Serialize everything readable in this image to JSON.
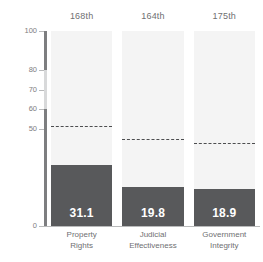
{
  "chart_data": {
    "type": "bar",
    "title": "",
    "subtitle": "",
    "xlabel": "",
    "ylabel": "",
    "ylim": [
      0,
      100
    ],
    "grid": false,
    "legend_position": "none",
    "categories": [
      "Property Rights",
      "Judicial Effectiveness",
      "Government Integrity"
    ],
    "series": [
      {
        "name": "Score",
        "values": [
          31.1,
          19.8,
          18.9
        ]
      },
      {
        "name": "Reference average",
        "values": [
          51.5,
          44.6,
          42.6
        ]
      }
    ],
    "value_labels": [
      "31.1",
      "19.8",
      "18.9"
    ],
    "rank_labels": [
      "168th",
      "164th",
      "175th"
    ],
    "y_ticks": [
      {
        "value": 100,
        "label": "100"
      },
      {
        "value": 80,
        "label": "80"
      },
      {
        "value": 70,
        "label": "70"
      },
      {
        "value": 60,
        "label": "60"
      },
      {
        "value": 50,
        "label": "50"
      },
      {
        "value": 0,
        "label": "0"
      }
    ],
    "colors": {
      "bar": "#58595b",
      "column_background": "#f4f4f4",
      "axis": "#7d7e80",
      "axis_light": "#d8d9da",
      "dashed_line": "#4c4d4f",
      "text": "#6f7072",
      "value_text": "#ffffff",
      "page_background": "#ffffff"
    }
  },
  "ranks": [
    {
      "label": "168th"
    },
    {
      "label": "164th"
    },
    {
      "label": "175th"
    }
  ],
  "categories": [
    {
      "line1": "Property",
      "line2": "Rights"
    },
    {
      "line1": "Judicial",
      "line2": "Effectiveness"
    },
    {
      "line1": "Government",
      "line2": "Integrity"
    }
  ],
  "bars": [
    {
      "value_label": "31.1"
    },
    {
      "value_label": "19.8"
    },
    {
      "value_label": "18.9"
    }
  ],
  "y_axis": {
    "ticks": [
      {
        "label": "100"
      },
      {
        "label": "80"
      },
      {
        "label": "70"
      },
      {
        "label": "60"
      },
      {
        "label": "50"
      },
      {
        "label": "0"
      }
    ]
  }
}
